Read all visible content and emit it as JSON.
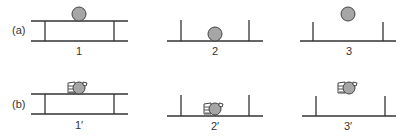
{
  "rows": [
    {
      "label": "(a)",
      "panels": [
        {
          "label": "1",
          "structure": "table",
          "object": "ball",
          "position": "on top of table"
        },
        {
          "label": "2",
          "structure": "posts",
          "object": "ball",
          "position": "on ground between posts"
        },
        {
          "label": "3",
          "structure": "posts",
          "object": "ball",
          "position": "floating above between posts"
        }
      ]
    },
    {
      "label": "(b)",
      "panels": [
        {
          "label": "1′",
          "structure": "table",
          "object": "hand-holding-ball",
          "position": "on top of table"
        },
        {
          "label": "2′",
          "structure": "posts",
          "object": "hand-holding-ball",
          "position": "on ground between posts"
        },
        {
          "label": "3′",
          "structure": "posts",
          "object": "hand-holding-ball",
          "position": "floating above between posts"
        }
      ]
    }
  ],
  "colors": {
    "line": "#333333",
    "ball_fill": "#a6a6a6",
    "background": "#ffffff"
  }
}
